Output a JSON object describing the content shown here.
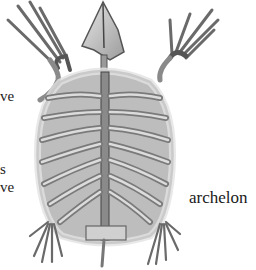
{
  "illustration": {
    "subject": "turtle skeleton (dorsal view)",
    "caption": "archelon"
  },
  "text_fragments": [
    {
      "text": "ve",
      "x": 0,
      "y": 97
    },
    {
      "text": "s",
      "x": 0,
      "y": 170
    },
    {
      "text": "ve",
      "x": 0,
      "y": 188
    }
  ],
  "colors": {
    "background": "#ffffff",
    "bone_light": "#d9d9d9",
    "bone_mid": "#a8a8a8",
    "bone_dark": "#555555",
    "text": "#1a1a1a"
  }
}
